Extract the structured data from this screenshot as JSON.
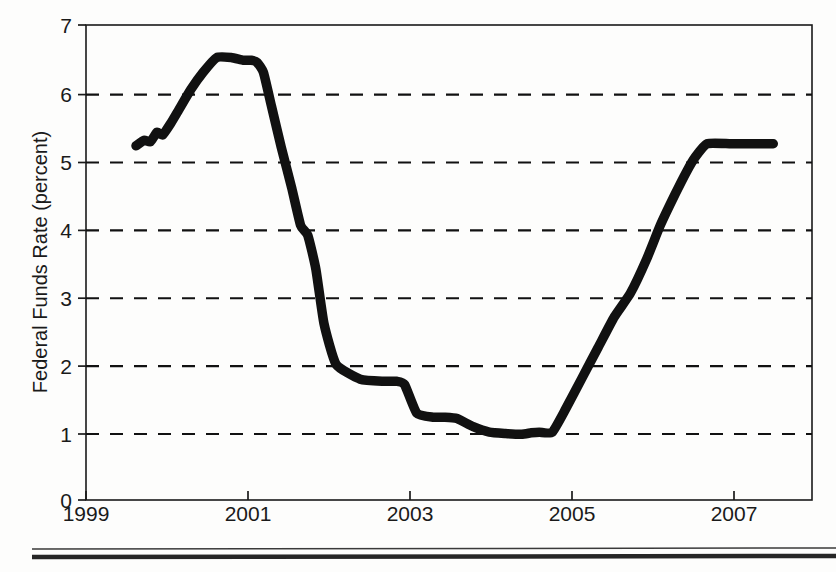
{
  "figure": {
    "background_color": "#fdfdfc",
    "ink_color": "#111111"
  },
  "chart_data": {
    "type": "line",
    "title": "",
    "subtitle": "",
    "xlabel": "",
    "ylabel": "Federal Funds Rate (percent)",
    "xlim": [
      1999,
      2008
    ],
    "ylim": [
      0,
      7
    ],
    "x_tick_labels": [
      "1999",
      "2001",
      "2003",
      "2005",
      "2007"
    ],
    "x_ticks": [
      1999,
      2001,
      2003,
      2005,
      2007
    ],
    "y_tick_labels": [
      "0",
      "1",
      "2",
      "3",
      "4",
      "5",
      "6",
      "7"
    ],
    "y_ticks": [
      0,
      1,
      2,
      3,
      4,
      5,
      6,
      7
    ],
    "grid": "horizontal dashed gridlines at 1, 2, 3, 4, 5, 6",
    "grid_values": [
      1,
      2,
      3,
      4,
      5,
      6
    ],
    "legend": "none",
    "legend_position": "none",
    "annotations": [],
    "series": [
      {
        "name": "Federal Funds Rate",
        "line_color": "#111111",
        "line_width_px": 9.5,
        "x": [
          1999.62,
          1999.72,
          1999.8,
          1999.88,
          1999.95,
          2000.05,
          2000.15,
          2000.3,
          2000.45,
          2000.62,
          2000.8,
          2000.95,
          2001.05,
          2001.12,
          2001.2,
          2001.3,
          2001.42,
          2001.55,
          2001.66,
          2001.75,
          2001.85,
          2001.95,
          2002.1,
          2002.4,
          2002.7,
          2002.85,
          2002.95,
          2003.1,
          2003.3,
          2003.45,
          2003.6,
          2003.8,
          2004.0,
          2004.2,
          2004.4,
          2004.52,
          2004.62,
          2004.78,
          2004.95,
          2005.15,
          2005.35,
          2005.55,
          2005.75,
          2005.95,
          2006.12,
          2006.3,
          2006.45,
          2006.55,
          2006.7,
          2007.0,
          2007.3,
          2007.52
        ],
        "y": [
          5.22,
          5.3,
          5.28,
          5.42,
          5.38,
          5.55,
          5.75,
          6.05,
          6.3,
          6.52,
          6.52,
          6.48,
          6.48,
          6.45,
          6.3,
          5.8,
          5.2,
          4.6,
          4.05,
          3.9,
          3.4,
          2.6,
          2.0,
          1.78,
          1.75,
          1.75,
          1.7,
          1.28,
          1.22,
          1.22,
          1.2,
          1.08,
          1.0,
          0.98,
          0.97,
          0.99,
          1.0,
          1.0,
          1.35,
          1.8,
          2.25,
          2.7,
          3.05,
          3.55,
          4.05,
          4.5,
          4.85,
          5.05,
          5.25,
          5.25,
          5.25,
          5.25
        ],
        "notes": "Step-like policy rate path: peak plateau at about 6.50 during 2000-2001, sharp decline through 2001, floor of about 1.00 in 2003-mid 2004, then steady rise to a 5.25 plateau from mid 2006 through mid 2007."
      }
    ],
    "key_points": [
      {
        "label": "series start",
        "x": 1999.62,
        "y": 5.22
      },
      {
        "label": "peak plateau",
        "x": 2000.7,
        "y": 6.5
      },
      {
        "label": "first floor",
        "x": 2002.5,
        "y": 1.75
      },
      {
        "label": "step down",
        "x": 2003.2,
        "y": 1.25
      },
      {
        "label": "trough",
        "x": 2004.3,
        "y": 1.0
      },
      {
        "label": "final plateau",
        "x": 2006.8,
        "y": 5.25
      },
      {
        "label": "series end",
        "x": 2007.52,
        "y": 5.25
      }
    ]
  },
  "footer_rules": {
    "thin_rule": "hairline rule",
    "thick_rule": "heavy rule"
  }
}
